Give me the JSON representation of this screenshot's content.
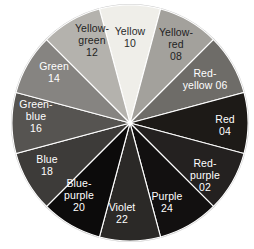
{
  "figure": {
    "kind": "color-wheel",
    "background_color": "#ffffff",
    "segment_count": 12,
    "center": {
      "x": 130,
      "y": 123
    },
    "radius": 118,
    "rim_color": "#c9c9c9"
  },
  "chart_data": {
    "type": "pie",
    "title": "",
    "subtitle": "",
    "xlabel": "",
    "ylabel": "",
    "legend_position": "in-slice",
    "grid": false,
    "note": "Twelve equal 30-degree hue segments rendered in greyscale; each slice is labelled with its hue name and two-digit hue number.",
    "categories": [
      "Yellow",
      "Yellow-red",
      "Red-yellow",
      "Red",
      "Red-purple",
      "Purple",
      "Violet",
      "Blue-purple",
      "Blue",
      "Green-blue",
      "Green",
      "Yellow-green"
    ],
    "values": [
      8.3333,
      8.3333,
      8.3333,
      8.3333,
      8.3333,
      8.3333,
      8.3333,
      8.3333,
      8.3333,
      8.3333,
      8.3333,
      8.3333
    ],
    "slice_codes": [
      "10",
      "08",
      "06",
      "04",
      "02",
      "24",
      "22",
      "20",
      "18",
      "16",
      "14",
      "12"
    ],
    "slice_colors": [
      "#efeee9",
      "#a3a19c",
      "#6e6c68",
      "#1d1a17",
      "#242120",
      "#121010",
      "#2b2927",
      "#0c0b0b",
      "#3d3b39",
      "#565451",
      "#868481",
      "#b4b2ad"
    ]
  },
  "segments": [
    {
      "name": "Yellow",
      "code": "10",
      "lines": [
        "Yellow",
        "10"
      ],
      "fill": "#efeee9",
      "text_color": "#2a2a2a",
      "start_angle": -15,
      "end_angle": 15,
      "label_x": 130,
      "label_y": 38
    },
    {
      "name": "Yellow-red",
      "code": "08",
      "lines": [
        "Yellow-",
        "red",
        "08"
      ],
      "fill": "#a3a19c",
      "text_color": "#1f1f1f",
      "start_angle": 15,
      "end_angle": 45,
      "label_x": 176,
      "label_y": 45
    },
    {
      "name": "Red-yellow",
      "code": "06",
      "lines": [
        "Red-",
        "yellow 06"
      ],
      "fill": "#6e6c68",
      "text_color": "#ffffff",
      "start_angle": 45,
      "end_angle": 75,
      "label_x": 205,
      "label_y": 80
    },
    {
      "name": "Red",
      "code": "04",
      "lines": [
        "Red",
        "04"
      ],
      "fill": "#1d1a17",
      "text_color": "#ffffff",
      "start_angle": 75,
      "end_angle": 105,
      "label_x": 225,
      "label_y": 126
    },
    {
      "name": "Red-purple",
      "code": "02",
      "lines": [
        "Red-",
        "purple",
        "02"
      ],
      "fill": "#242120",
      "text_color": "#ffffff",
      "start_angle": 105,
      "end_angle": 135,
      "label_x": 205,
      "label_y": 176
    },
    {
      "name": "Purple",
      "code": "24",
      "lines": [
        "Purple",
        "24"
      ],
      "fill": "#121010",
      "text_color": "#ffffff",
      "start_angle": 135,
      "end_angle": 165,
      "label_x": 167,
      "label_y": 203
    },
    {
      "name": "Violet",
      "code": "22",
      "lines": [
        "Violet",
        "22"
      ],
      "fill": "#2b2927",
      "text_color": "#ffffff",
      "start_angle": 165,
      "end_angle": 195,
      "label_x": 122,
      "label_y": 214
    },
    {
      "name": "Blue-purple",
      "code": "20",
      "lines": [
        "Blue-",
        "purple",
        "20"
      ],
      "fill": "#0c0b0b",
      "text_color": "#ffffff",
      "start_angle": 195,
      "end_angle": 225,
      "label_x": 79,
      "label_y": 196
    },
    {
      "name": "Blue",
      "code": "18",
      "lines": [
        "Blue",
        "18"
      ],
      "fill": "#3d3b39",
      "text_color": "#ffffff",
      "start_angle": 225,
      "end_angle": 255,
      "label_x": 47,
      "label_y": 166
    },
    {
      "name": "Green-blue",
      "code": "16",
      "lines": [
        "Green-",
        "blue",
        "16"
      ],
      "fill": "#565451",
      "text_color": "#ffffff",
      "start_angle": 255,
      "end_angle": 285,
      "label_x": 36,
      "label_y": 117
    },
    {
      "name": "Green",
      "code": "14",
      "lines": [
        "Green",
        "14"
      ],
      "fill": "#868481",
      "text_color": "#ffffff",
      "start_angle": 285,
      "end_angle": 315,
      "label_x": 54,
      "label_y": 73
    },
    {
      "name": "Yellow-green",
      "code": "12",
      "lines": [
        "Yellow-",
        "green",
        "12"
      ],
      "fill": "#b4b2ad",
      "text_color": "#1f1f1f",
      "start_angle": 315,
      "end_angle": 345,
      "label_x": 92,
      "label_y": 41
    }
  ]
}
